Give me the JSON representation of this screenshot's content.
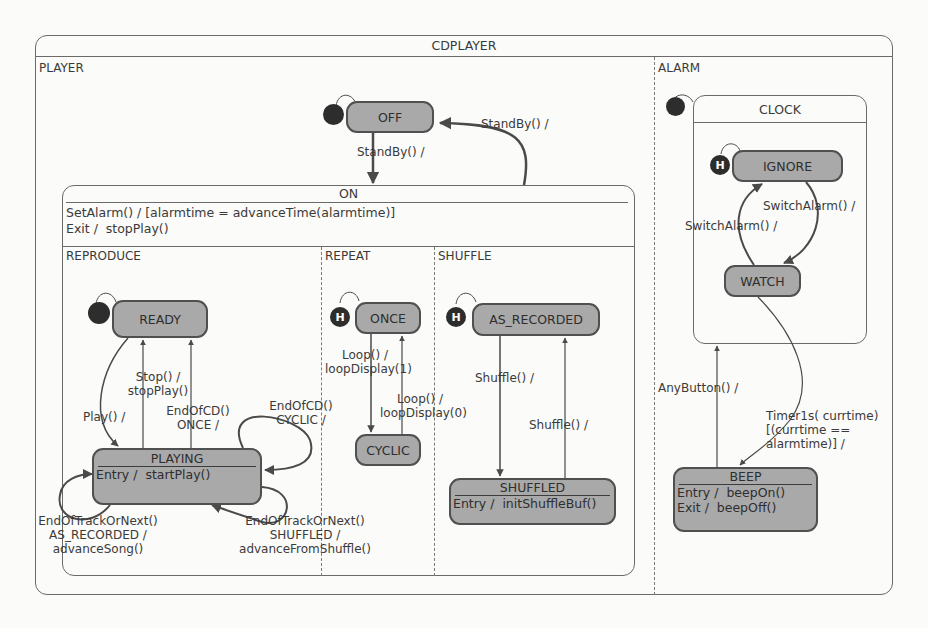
{
  "diagram": {
    "title": "CDPLAYER",
    "regions": {
      "player": "PLAYER",
      "alarm": "ALARM",
      "reproduce": "REPRODUCE",
      "repeat": "REPEAT",
      "shuffle": "SHUFFLE"
    },
    "states": {
      "off": "OFF",
      "on": {
        "name": "ON",
        "actions": [
          "SetAlarm() / [alarmtime = advanceTime(alarmtime)]",
          "Exit /  stopPlay()"
        ]
      },
      "ready": "READY",
      "playing": {
        "name": "PLAYING",
        "actions": [
          "Entry /  startPlay()"
        ]
      },
      "once": "ONCE",
      "cyclic": "CYCLIC",
      "as_recorded": "AS_RECORDED",
      "shuffled": {
        "name": "SHUFFLED",
        "actions": [
          "Entry /  initShuffleBuf()"
        ]
      },
      "clock": "CLOCK",
      "ignore": "IGNORE",
      "watch": "WATCH",
      "beep": {
        "name": "BEEP",
        "actions": [
          "Entry /  beepOn()",
          "Exit /  beepOff()"
        ]
      }
    },
    "pseudostates": {
      "history_label": "H"
    },
    "transitions": {
      "off_to_on": "StandBy() /",
      "on_to_off": "StandBy() /",
      "stop": "Stop() /\nstopPlay()",
      "play": "Play() /",
      "endofcd_once": "EndOfCD()\nONCE /",
      "endofcd_cyclic": "EndOfCD()\nCYCLIC /",
      "next_as_recorded": "EndOfTrackOrNext()\nAS_RECORDED /\nadvanceSong()",
      "next_shuffled": "EndOfTrackOrNext()\nSHUFFLED /\nadvanceFromShuffle()",
      "loop_to_cyclic": "Loop() /\nloopDisplay(1)",
      "loop_to_once": "Loop() /\nloopDisplay(0)",
      "shuffle_on": "Shuffle() /",
      "shuffle_off": "Shuffle() /",
      "switch_to_watch": "SwitchAlarm() /",
      "switch_to_ignore": "SwitchAlarm() /",
      "anybutton": "AnyButton() /",
      "timer": "Timer1s( currtime)\n[(currtime ==\nalarmtime)] /"
    },
    "colors": {
      "state_fill": "#a9a9a9",
      "state_border": "#505050",
      "container_border": "#6a6a6a",
      "pseudostate": "#2d2d2d",
      "background": "#fbfbf9"
    }
  }
}
